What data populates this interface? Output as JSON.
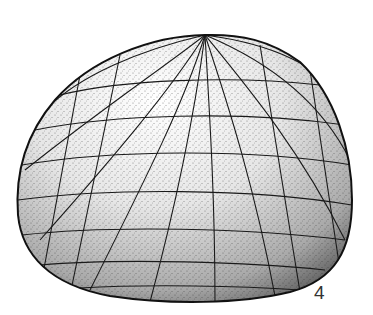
{
  "figure": {
    "label": "4",
    "colors": {
      "background": "#ffffff",
      "ink": "#111111",
      "label": "#333333"
    }
  }
}
